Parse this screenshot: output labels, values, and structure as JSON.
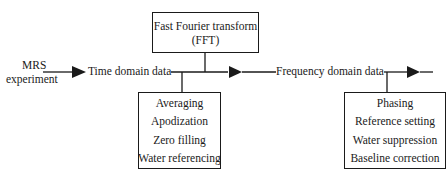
{
  "diagram": {
    "type": "flowchart",
    "input": {
      "line1": "MRS",
      "line2": "experiment"
    },
    "nodes": {
      "time_domain": "Time domain data",
      "frequency_domain": "Frequency domain data"
    },
    "fft_box": {
      "line1": "Fast Fourier transform",
      "line2": "(FFT)"
    },
    "time_processing": [
      "Averaging",
      "Apodization",
      "Zero filling",
      "Water referencing"
    ],
    "frequency_processing": [
      "Phasing",
      "Reference setting",
      "Water suppression",
      "Baseline correction"
    ],
    "colors": {
      "line": "#1a1a1a",
      "background": "#ffffff"
    }
  }
}
